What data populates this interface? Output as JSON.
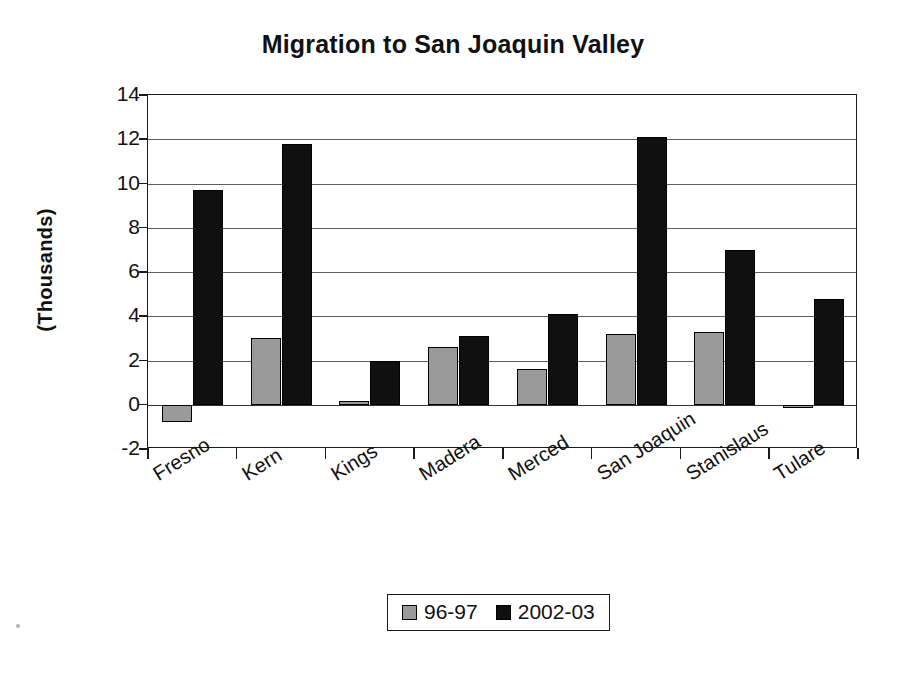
{
  "chart_data": {
    "type": "bar",
    "title": "Migration to San Joaquin Valley",
    "xlabel": "",
    "ylabel": "(Thousands)",
    "ylim": [
      -2,
      14
    ],
    "yticks": [
      14,
      12,
      10,
      8,
      6,
      4,
      2,
      0,
      -2
    ],
    "ytick_labels": [
      "14",
      "12",
      "10",
      "8",
      "6",
      "4",
      "2",
      "0",
      "-2"
    ],
    "grid": true,
    "legend_position": "bottom",
    "categories": [
      "Fresno",
      "Kern",
      "Kings",
      "Madera",
      "Merced",
      "San Joaquin",
      "Stanislaus",
      "Tulare"
    ],
    "series": [
      {
        "name": "96-97",
        "color": "#9a9a9a",
        "values": [
          -0.8,
          3.0,
          0.15,
          2.6,
          1.6,
          3.2,
          3.3,
          -0.15
        ]
      },
      {
        "name": "2002-03",
        "color": "#101010",
        "values": [
          9.7,
          11.8,
          2.0,
          3.1,
          4.1,
          12.1,
          7.0,
          4.8
        ]
      }
    ]
  },
  "legend": {
    "items": [
      {
        "label": "96-97",
        "swatch": "#9a9a9a"
      },
      {
        "label": "2002-03",
        "swatch": "#101010"
      }
    ]
  }
}
